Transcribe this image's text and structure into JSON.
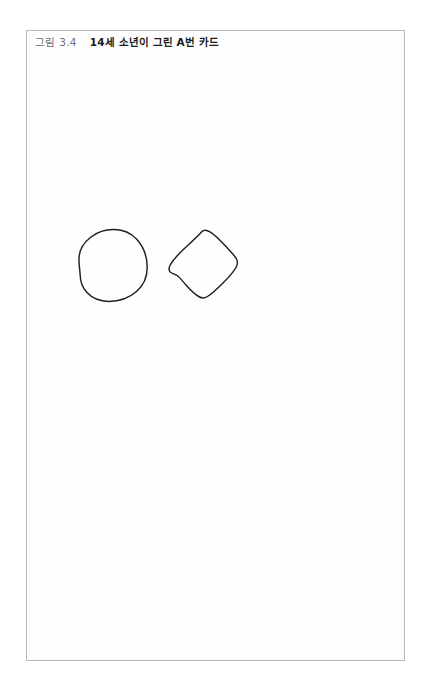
{
  "page": {
    "background_color": "#ffffff",
    "width": 431,
    "height": 692,
    "cutoff_text": "."
  },
  "figure": {
    "border_color": "#b9b9bd",
    "background_color": "#fefefe",
    "caption": {
      "label": "그림 3.4",
      "title": "14세 소년이 그린 A번 카드",
      "full_text": "그림 3.4    14세 소년이 그린 A번 카드",
      "label_color": "#6e6e72",
      "title_color": "#1b1b1b"
    },
    "drawing": {
      "ink_color": "#231f20",
      "stroke_width": 1.45,
      "shapes": [
        {
          "name": "hand-drawn-circle",
          "description": "rough freehand circle / egg shape",
          "bounds": {
            "x": 78,
            "y": 228,
            "width": 68,
            "height": 72
          },
          "path": "M 120 4 C 103 1 86 8 76 21 C 66 33 62 49 63 61 C 64 72 71 80 79 83 C 88 86 97 81 103 73 C 108 66 110 58 109 50 C 108 41 104 33 97 28 C 90 23 81 22 74 26"
        },
        {
          "name": "hand-drawn-diamond",
          "description": "rough freehand rounded diamond / tilted square",
          "bounds": {
            "x": 168,
            "y": 230,
            "width": 69,
            "height": 67
          },
          "path": "M 0 0 L 0 0"
        }
      ]
    }
  }
}
